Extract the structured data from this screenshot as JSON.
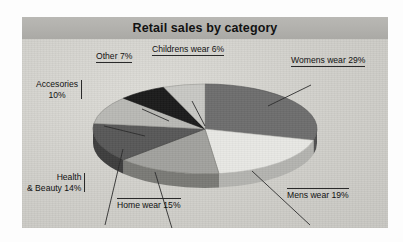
{
  "chart": {
    "title": "Retail sales by category",
    "frame_color": "#d3d2cd",
    "banner_color": "#b2b1ad"
  },
  "chart_data": {
    "type": "pie",
    "title": "Retail sales by category",
    "three_d": true,
    "legend": "none (direct callout labels)",
    "unit": "percent",
    "categories": [
      "Womens wear",
      "Mens wear",
      "Home wear",
      "Health & Beauty",
      "Accesories",
      "Other",
      "Childrens wear"
    ],
    "values": [
      29,
      19,
      15,
      14,
      10,
      7,
      6
    ],
    "labels": [
      "Womens wear 29%",
      "Mens wear 19%",
      "Home wear 15%",
      "Health & Beauty 14%",
      "Accesories 10%",
      "Other 7%",
      "Childrens wear 6%"
    ],
    "colors": [
      "#6e6e6e",
      "#e8e8e4",
      "#a2a29e",
      "#585858",
      "#b9b9b5",
      "#1b1b1b",
      "#c8c8c4"
    ],
    "side_colors": [
      "#4f4f4f",
      "#b4b4b0",
      "#7a7a76",
      "#3d3d3d",
      "#8c8c88",
      "#111111",
      "#989894"
    ],
    "start_angle_deg": 0,
    "direction": "clockwise"
  },
  "labels": {
    "womens": {
      "text": "Womens wear 29%"
    },
    "mens": {
      "text": "Mens wear 19%"
    },
    "home": {
      "text": "Home wear 15%"
    },
    "health_line1": "Health",
    "health_line2": "& Beauty 14%",
    "accesories_line1": "Accesories",
    "accesories_line2": "10%",
    "other": {
      "text": "Other 7%"
    },
    "childrens": {
      "text": "Childrens wear 6%"
    }
  }
}
